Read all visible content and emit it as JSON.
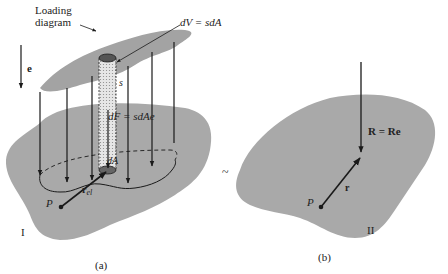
{
  "figure": {
    "colors": {
      "region_fill": "#a9a9a9",
      "loading_fill": "#a3a3a3",
      "line": "#1a1a1a",
      "background": "#ffffff"
    },
    "panel_a": {
      "caption": "(a)",
      "region_label": "I",
      "loading_label_line1": "Loading",
      "loading_label_line2": "diagram",
      "direction_label": "e",
      "dV_label": "dV = sdA",
      "s_label": "s",
      "dF_label": "dF = sdAe",
      "dA_label": "dA",
      "r_label": "r",
      "r_subscript": "el",
      "point_label": "P"
    },
    "equivalence_symbol": "~",
    "panel_b": {
      "caption": "(b)",
      "region_label": "II",
      "resultant_label": "R = Re",
      "r_label": "r",
      "point_label": "P"
    }
  }
}
